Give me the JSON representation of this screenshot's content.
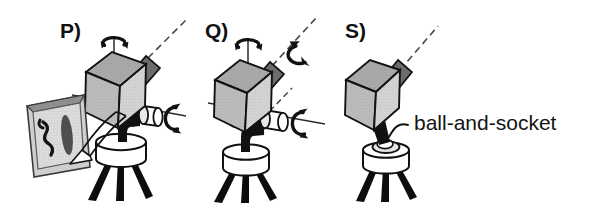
{
  "figure": {
    "background": "#ffffff",
    "ink": "#111111",
    "width": 591,
    "height": 216,
    "panels": [
      {
        "id": "P",
        "label": "P)",
        "label_x": 60,
        "label_y": 38,
        "description": "camera on tripod with pan axis, tilt axis and framed picture",
        "has_picture_frame": true,
        "rotation_arrows": [
          "vertical-pan-arrow",
          "horizontal-tilt-arrow"
        ],
        "axis_lines": [
          "vertical-axis",
          "horizontal-axis",
          "optical-axis-dashed"
        ]
      },
      {
        "id": "Q",
        "label": "Q)",
        "label_x": 205,
        "label_y": 38,
        "description": "camera on tripod with pan, roll and tilt axes",
        "has_picture_frame": false,
        "rotation_arrows": [
          "vertical-pan-arrow",
          "optical-roll-arrow",
          "horizontal-tilt-arrow"
        ],
        "axis_lines": [
          "vertical-axis",
          "horizontal-axis",
          "optical-axis-dashed",
          "pivot-axis-dashed"
        ]
      },
      {
        "id": "S",
        "label": "S)",
        "label_x": 345,
        "label_y": 38,
        "description": "camera on tripod mounted on ball-and-socket joint",
        "has_picture_frame": false,
        "rotation_arrows": [],
        "axis_lines": [
          "optical-axis-dashed"
        ]
      }
    ],
    "annotations": [
      {
        "name": "ball-and-socket-label",
        "text": "ball-and-socket",
        "x": 412,
        "y": 129,
        "leader_from": [
          407,
          124
        ],
        "leader_to": [
          383,
          136
        ]
      }
    ],
    "colors": {
      "cube_top": "#a9a9a9",
      "cube_left": "#b9b9b9",
      "cube_right": "#d2d2d2",
      "lens": "#6d6d6d",
      "outline": "#111111",
      "tripod": "#0d0d0d",
      "frame_mat": "#c9c9c9",
      "frame_edge": "#8c8c8c",
      "arrow": "#111111",
      "axis": "#3a3a3a"
    }
  }
}
